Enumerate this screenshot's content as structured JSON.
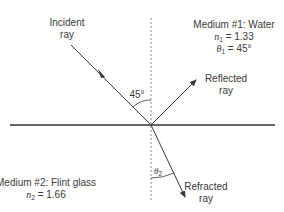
{
  "diagram": {
    "type": "refraction-reflection",
    "incident_ray": {
      "label_line1": "Incident",
      "label_line2": "ray"
    },
    "reflected_ray": {
      "label_line1": "Reflected",
      "label_line2": "ray"
    },
    "refracted_ray": {
      "label_line1": "Refracted",
      "label_line2": "ray"
    },
    "incident_angle_label": "45°",
    "refraction_angle_symbol": "θ",
    "refraction_angle_subscript": "2",
    "medium1": {
      "title": "Medium #1: Water",
      "n_symbol": "n",
      "n_subscript": "1",
      "n_value": " = 1.33",
      "theta_symbol": "θ",
      "theta_subscript": "1",
      "theta_value": " = 45°"
    },
    "medium2": {
      "title": "Medium #2: Flint glass",
      "n_symbol": "n",
      "n_subscript": "2",
      "n_value": " = 1.66"
    },
    "colors": {
      "line": "#3a3a3a",
      "normal": "#8a8a8a",
      "interface": "#333333"
    }
  }
}
